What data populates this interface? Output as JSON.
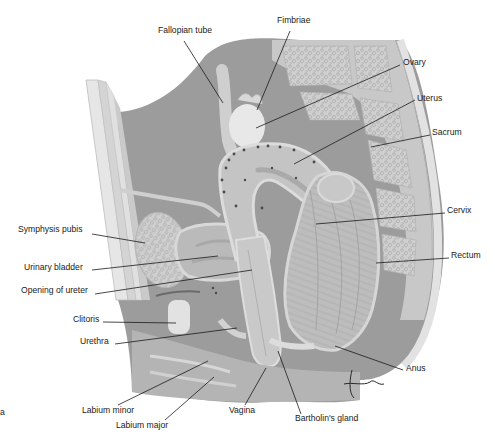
{
  "figure": {
    "type": "anatomical-illustration",
    "colors": {
      "background": "#ffffff",
      "cavity": "#9c9c9c",
      "tissue_mid": "#b8b8b8",
      "tissue_light": "#d2d2d2",
      "bone": "#cfcfcf",
      "bone_texture": "#a9a9a9",
      "highlight": "#e9e9e9",
      "line": "#1a1a1a",
      "dots": "#4a4a4a"
    },
    "signature": "Tim"
  },
  "labels": [
    {
      "id": "fallopian-tube",
      "text": "Fallopian tube",
      "x": 158,
      "y": 29,
      "align": "left",
      "line": [
        [
          184,
          41
        ],
        [
          223,
          103
        ]
      ]
    },
    {
      "id": "fimbriae",
      "text": "Fimbriae",
      "x": 277,
      "y": 19,
      "align": "left",
      "line": [
        [
          290,
          31
        ],
        [
          257,
          110
        ]
      ]
    },
    {
      "id": "ovary",
      "text": "Ovary",
      "x": 403,
      "y": 61,
      "align": "left",
      "line": [
        [
          400,
          65
        ],
        [
          256,
          128
        ]
      ]
    },
    {
      "id": "uterus",
      "text": "Uterus",
      "x": 417,
      "y": 97,
      "align": "left",
      "line": [
        [
          415,
          100
        ],
        [
          294,
          164
        ]
      ]
    },
    {
      "id": "sacrum",
      "text": "Sacrum",
      "x": 432,
      "y": 131,
      "align": "left",
      "line": [
        [
          430,
          135
        ],
        [
          371,
          147
        ]
      ]
    },
    {
      "id": "symphysis-pubis",
      "text": "Symphysis pubis",
      "x": 18,
      "y": 228,
      "align": "left",
      "line": [
        [
          92,
          234
        ],
        [
          145,
          243
        ]
      ]
    },
    {
      "id": "cervix",
      "text": "Cervix",
      "x": 447,
      "y": 209,
      "align": "left",
      "line": [
        [
          445,
          213
        ],
        [
          316,
          224
        ]
      ]
    },
    {
      "id": "urinary-bladder",
      "text": "Urinary bladder",
      "x": 24,
      "y": 266,
      "align": "left",
      "line": [
        [
          92,
          270
        ],
        [
          218,
          256
        ]
      ]
    },
    {
      "id": "rectum",
      "text": "Rectum",
      "x": 451,
      "y": 254,
      "align": "left",
      "line": [
        [
          449,
          258
        ],
        [
          376,
          263
        ]
      ]
    },
    {
      "id": "opening-of-ureter",
      "text": "Opening of ureter",
      "x": 21,
      "y": 289,
      "align": "left",
      "line": [
        [
          95,
          294
        ],
        [
          252,
          270
        ]
      ]
    },
    {
      "id": "clitoris",
      "text": "Clitoris",
      "x": 73,
      "y": 318,
      "align": "left",
      "line": [
        [
          103,
          322
        ],
        [
          176,
          323
        ]
      ]
    },
    {
      "id": "urethra",
      "text": "Urethra",
      "x": 80,
      "y": 340,
      "align": "left",
      "line": [
        [
          115,
          344
        ],
        [
          237,
          328
        ]
      ]
    },
    {
      "id": "anus",
      "text": "Anus",
      "x": 406,
      "y": 367,
      "align": "left",
      "line": [
        [
          403,
          370
        ],
        [
          335,
          346
        ]
      ]
    },
    {
      "id": "labium-minor",
      "text": "Labium minor",
      "x": 82,
      "y": 409,
      "align": "left",
      "line": [
        [
          118,
          405
        ],
        [
          208,
          361
        ]
      ]
    },
    {
      "id": "vagina",
      "text": "Vagina",
      "x": 229,
      "y": 409,
      "align": "left",
      "line": [
        [
          245,
          405
        ],
        [
          266,
          368
        ]
      ]
    },
    {
      "id": "labium-major",
      "text": "Labium major",
      "x": 116,
      "y": 424,
      "align": "left",
      "line": [
        [
          165,
          420
        ],
        [
          214,
          377
        ]
      ]
    },
    {
      "id": "bartholins-gland",
      "text": "Bartholin's gland",
      "x": 295,
      "y": 417,
      "align": "left",
      "line": [
        [
          301,
          414
        ],
        [
          278,
          351
        ]
      ]
    }
  ],
  "stray_mark": {
    "text": "a",
    "x": 0,
    "y": 411
  }
}
